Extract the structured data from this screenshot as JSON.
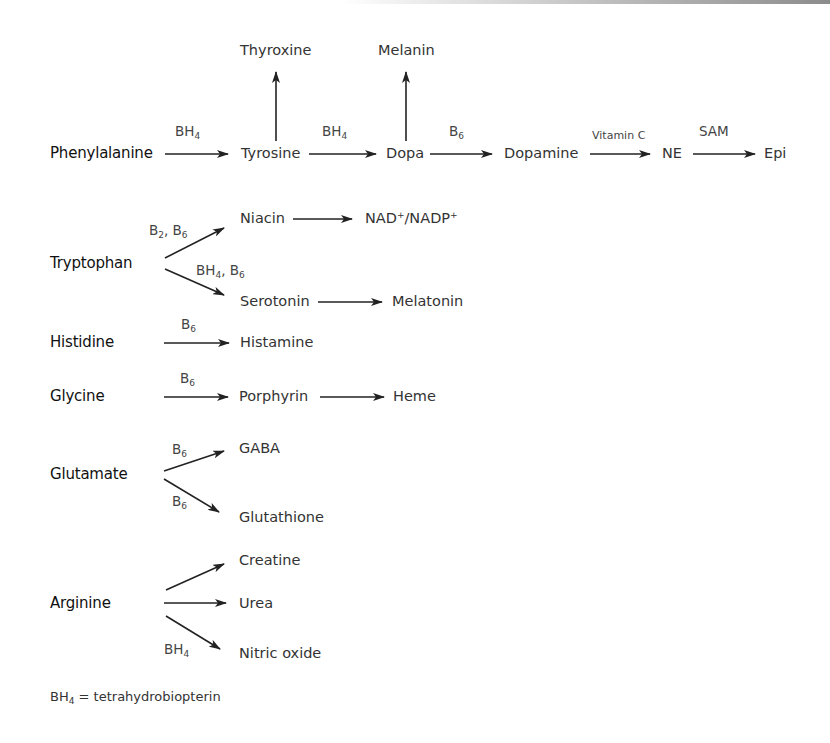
{
  "pathways": {
    "phenylalanine": {
      "source": "Phenylalanine",
      "steps": [
        {
          "cofactor": "BH",
          "cofactor_sub": "4",
          "product": "Tyrosine"
        },
        {
          "cofactor": "BH",
          "cofactor_sub": "4",
          "product": "Dopa"
        },
        {
          "cofactor": "B",
          "cofactor_sub": "6",
          "product": "Dopamine"
        },
        {
          "cofactor": "Vitamin C",
          "product": "NE"
        },
        {
          "cofactor": "SAM",
          "product": "Epi"
        }
      ],
      "branches": {
        "tyrosine_up": "Thyroxine",
        "dopa_up": "Melanin"
      }
    },
    "tryptophan": {
      "source": "Tryptophan",
      "upper": {
        "cofactor": "B2, B6",
        "c1": "B",
        "c1_sub": "2",
        "c2": "B",
        "c2_sub": "6",
        "product": "Niacin",
        "next": "NAD",
        "next_sup": "+",
        "next2": "/NADP",
        "next2_sup": "+"
      },
      "lower": {
        "c1": "BH",
        "c1_sub": "4",
        "c2": "B",
        "c2_sub": "6",
        "product": "Serotonin",
        "next": "Melatonin"
      }
    },
    "histidine": {
      "source": "Histidine",
      "cofactor": "B",
      "cofactor_sub": "6",
      "product": "Histamine"
    },
    "glycine": {
      "source": "Glycine",
      "cofactor": "B",
      "cofactor_sub": "6",
      "product": "Porphyrin",
      "next": "Heme"
    },
    "glutamate": {
      "source": "Glutamate",
      "upper": {
        "cofactor": "B",
        "cofactor_sub": "6",
        "product": "GABA"
      },
      "lower": {
        "cofactor": "B",
        "cofactor_sub": "6",
        "product": "Glutathione"
      }
    },
    "arginine": {
      "source": "Arginine",
      "upper": {
        "product": "Creatine"
      },
      "middle": {
        "product": "Urea"
      },
      "lower": {
        "cofactor": "BH",
        "cofactor_sub": "4",
        "product": "Nitric oxide"
      }
    }
  },
  "footnote": {
    "abbr": "BH",
    "abbr_sub": "4",
    "text": " = tetrahydrobiopterin"
  }
}
